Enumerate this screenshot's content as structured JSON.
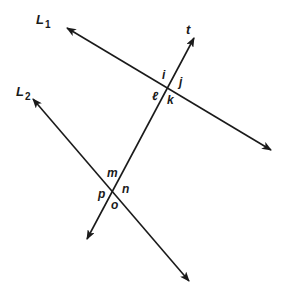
{
  "diagram": {
    "colors": {
      "line": "#1a1a1a",
      "background": "#ffffff"
    },
    "lines": [
      {
        "id": "L1",
        "label": "L",
        "subscript": "1",
        "from": [
          67,
          28
        ],
        "to": [
          271,
          150
        ],
        "label_pos": [
          36,
          24
        ]
      },
      {
        "id": "L2",
        "label": "L",
        "subscript": "2",
        "from": [
          33,
          99
        ],
        "to": [
          189,
          281
        ],
        "label_pos": [
          16,
          96
        ]
      },
      {
        "id": "t",
        "label": "t",
        "from": [
          87,
          239
        ],
        "to": [
          194,
          38
        ],
        "label_pos": [
          186,
          34
        ]
      }
    ],
    "angles": [
      {
        "name": "i",
        "pos": [
          162,
          79
        ]
      },
      {
        "name": "j",
        "pos": [
          179,
          86
        ]
      },
      {
        "name": "ℓ",
        "pos": [
          152,
          100
        ]
      },
      {
        "name": "k",
        "pos": [
          167,
          104
        ]
      },
      {
        "name": "m",
        "pos": [
          107,
          177
        ]
      },
      {
        "name": "n",
        "pos": [
          122,
          193
        ]
      },
      {
        "name": "p",
        "pos": [
          98,
          198
        ]
      },
      {
        "name": "o",
        "pos": [
          111,
          209
        ]
      }
    ]
  }
}
